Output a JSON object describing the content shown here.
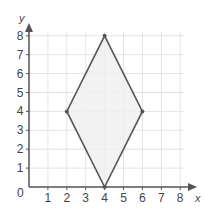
{
  "chart_data": {
    "type": "scatter",
    "title": "",
    "xlabel": "x",
    "ylabel": "y",
    "xlim": [
      0,
      8
    ],
    "ylim": [
      0,
      8
    ],
    "grid": true,
    "x_ticks": [
      "1",
      "2",
      "3",
      "4",
      "5",
      "6",
      "7",
      "8"
    ],
    "y_ticks": [
      "1",
      "2",
      "3",
      "4",
      "5",
      "6",
      "7",
      "8"
    ],
    "origin_label": "0",
    "shapes": [
      {
        "name": "rhombus",
        "vertices": [
          [
            4,
            8
          ],
          [
            6,
            4
          ],
          [
            4,
            0
          ],
          [
            2,
            4
          ]
        ],
        "fill": "#eeeeee",
        "stroke": "#555555"
      }
    ]
  }
}
